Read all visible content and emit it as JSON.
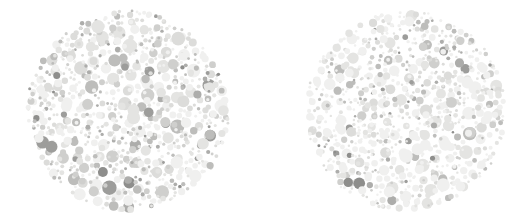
{
  "image": {
    "title": "Pseudoisochromatic dot plate pair",
    "subject": "Ishihara-style color vision test plates rendered in grayscale",
    "width": 527,
    "height": 224,
    "background_color": "#ffffff",
    "plate_count": 2,
    "layout": "two circular plates side by side, horizontally aligned"
  },
  "palette": {
    "background": "#ffffff",
    "dot_very_light": "#f0f0ef",
    "dot_light": "#e4e4e2",
    "dot_pale": "#dcdcda",
    "dot_mid_light": "#cfcfcd",
    "dot_mid": "#bdbdbb",
    "dot_mid_dark": "#adadab",
    "dot_dark": "#9d9d9b",
    "dot_darkest": "#8e8e8c"
  },
  "plates": [
    {
      "id": "plate-left",
      "name": "left-plate",
      "label": "Left plate",
      "center_x": 128,
      "center_y": 111,
      "radius": 103,
      "dot_count": 820,
      "dot_radius_min": 1.4,
      "dot_radius_max": 7.6,
      "contrast": "higher",
      "dominant_tone": "#c3c3c1",
      "description": "Dense mosaic of grey dots with many mid-grey and darker dots mixed among pale dots; texture appears mottled"
    },
    {
      "id": "plate-right",
      "name": "right-plate",
      "label": "Right plate",
      "center_x": 406,
      "center_y": 111,
      "radius": 102,
      "dot_count": 880,
      "dot_radius_min": 1.2,
      "dot_radius_max": 6.8,
      "contrast": "lower",
      "dominant_tone": "#e0e0de",
      "description": "Dense mosaic dominated by very pale dots with sparser scattered mid-grey dots; texture appears lighter and more uniform"
    }
  ],
  "chart_data": {
    "type": "scatter",
    "xlabel": "",
    "ylabel": "",
    "xlim": [
      0,
      527
    ],
    "ylim": [
      0,
      224
    ],
    "grid": false,
    "legend": "none",
    "series": [
      {
        "name": "left-plate-dots",
        "center": [
          128,
          111
        ],
        "radius": 103,
        "count": 820,
        "tone_weights": [
          0.3,
          0.22,
          0.16,
          0.12,
          0.1,
          0.06,
          0.03,
          0.01
        ]
      },
      {
        "name": "right-plate-dots",
        "center": [
          406,
          111
        ],
        "radius": 102,
        "count": 880,
        "tone_weights": [
          0.42,
          0.24,
          0.14,
          0.08,
          0.06,
          0.03,
          0.02,
          0.01
        ]
      }
    ]
  }
}
